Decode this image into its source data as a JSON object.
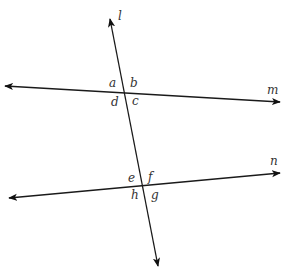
{
  "diagram": {
    "colors": {
      "line": "#1a1a1a",
      "text": "#333333",
      "background": "#ffffff"
    },
    "lines": [
      {
        "name": "l",
        "role": "transversal",
        "x1": 110,
        "y1": 19,
        "x2": 158,
        "y2": 266,
        "arrows": "both"
      },
      {
        "name": "m",
        "role": "line",
        "x1": 5,
        "y1": 86,
        "x2": 280,
        "y2": 102,
        "arrows": "both"
      },
      {
        "name": "n",
        "role": "line",
        "x1": 9,
        "y1": 198,
        "x2": 280,
        "y2": 173,
        "arrows": "both"
      }
    ],
    "line_labels": {
      "l": {
        "text": "l",
        "x": 118,
        "y": 20
      },
      "m": {
        "text": "m",
        "x": 267,
        "y": 94
      },
      "n": {
        "text": "n",
        "x": 270,
        "y": 165
      }
    },
    "intersections": [
      {
        "lines": [
          "l",
          "m"
        ],
        "x": 125,
        "y": 92,
        "angles": [
          "a",
          "b",
          "c",
          "d"
        ]
      },
      {
        "lines": [
          "l",
          "n"
        ],
        "x": 144,
        "y": 186,
        "angles": [
          "e",
          "f",
          "g",
          "h"
        ]
      }
    ],
    "angle_labels": {
      "a": {
        "text": "a",
        "x": 109,
        "y": 87
      },
      "b": {
        "text": "b",
        "x": 130,
        "y": 87
      },
      "c": {
        "text": "c",
        "x": 132,
        "y": 105
      },
      "d": {
        "text": "d",
        "x": 111,
        "y": 106
      },
      "e": {
        "text": "e",
        "x": 128,
        "y": 182
      },
      "f": {
        "text": "f",
        "x": 148,
        "y": 181
      },
      "g": {
        "text": "g",
        "x": 151,
        "y": 199
      },
      "h": {
        "text": "h",
        "x": 131,
        "y": 199
      }
    }
  }
}
